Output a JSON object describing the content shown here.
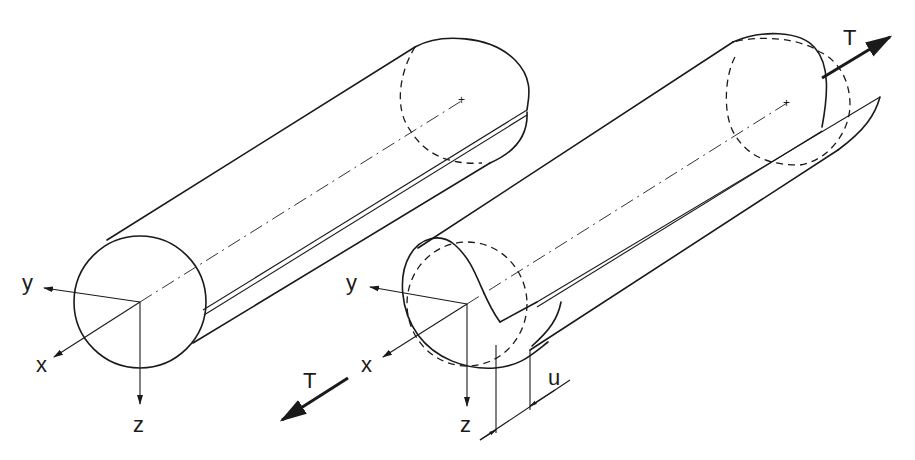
{
  "diagram": {
    "left_tube": {
      "axes": {
        "y": "y",
        "x": "x",
        "z": "z"
      }
    },
    "right_tube": {
      "axes": {
        "y": "y",
        "x": "x",
        "z": "z"
      },
      "torque_front_label": "T",
      "torque_back_label": "T",
      "displacement_label": "u"
    }
  }
}
